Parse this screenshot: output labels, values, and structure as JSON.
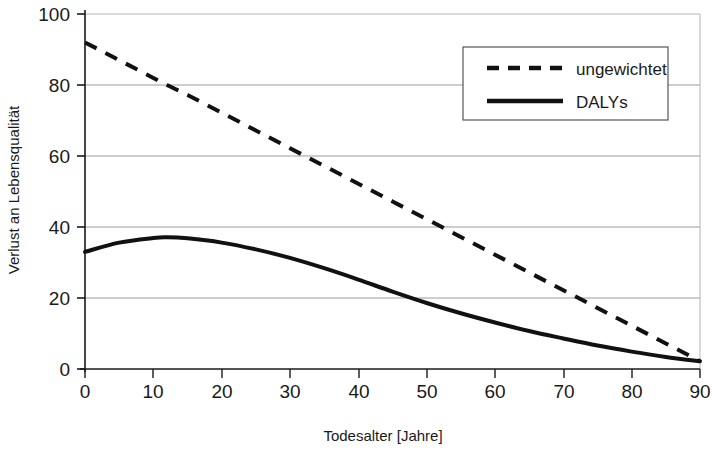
{
  "chart_data": {
    "type": "line",
    "title": "",
    "xlabel": "Todesalter [Jahre]",
    "ylabel": "Verlust an Lebensqualität",
    "xlim": [
      0,
      90
    ],
    "ylim": [
      0,
      100
    ],
    "xticks": [
      0,
      10,
      20,
      30,
      40,
      50,
      60,
      70,
      80,
      90
    ],
    "xtick_labels": [
      "0",
      "10",
      "20",
      "30",
      "40",
      "50",
      "60",
      "70",
      "80",
      "90"
    ],
    "yticks": [
      0,
      20,
      40,
      60,
      80,
      100
    ],
    "ytick_labels": [
      "0",
      "20",
      "40",
      "60",
      "80",
      "100"
    ],
    "grid": "horizontal",
    "legend_position": "top-right",
    "x": [
      0,
      5,
      10,
      12,
      15,
      20,
      25,
      30,
      35,
      40,
      45,
      50,
      55,
      60,
      65,
      70,
      75,
      80,
      85,
      90
    ],
    "series": [
      {
        "name": "ungewichtet",
        "style": "dashed",
        "color": "#111111",
        "values": [
          92,
          87,
          82,
          80,
          77.2,
          72.2,
          67.2,
          62.2,
          57.2,
          52.2,
          47.2,
          42.2,
          37.2,
          32.2,
          27.2,
          22.2,
          17.2,
          12.2,
          7.2,
          2.2
        ]
      },
      {
        "name": "DALYs",
        "style": "solid",
        "color": "#111111",
        "values": [
          33,
          35.6,
          36.9,
          37.1,
          36.8,
          35.6,
          33.7,
          31.3,
          28.4,
          25.2,
          21.8,
          18.6,
          15.7,
          13.1,
          10.7,
          8.6,
          6.6,
          4.9,
          3.4,
          2.2
        ]
      }
    ],
    "legend": [
      {
        "label": "ungewichtet",
        "style": "dashed"
      },
      {
        "label": "DALYs",
        "style": "solid"
      }
    ],
    "colors": {
      "line": "#111111",
      "grid": "#9b9b9b",
      "axis": "#1a1a1a",
      "background": "#ffffff"
    }
  }
}
